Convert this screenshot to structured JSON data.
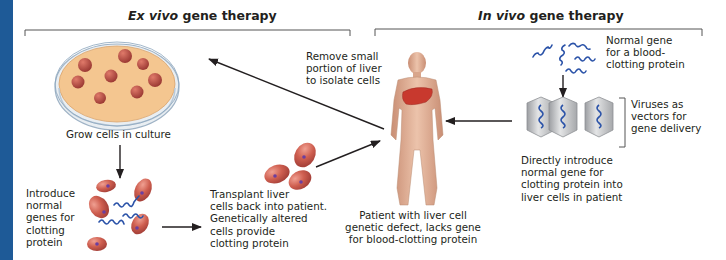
{
  "headings": {
    "ex_vivo": {
      "italic": "Ex vivo",
      "rest": " gene therapy"
    },
    "in_vivo": {
      "italic": "In vivo",
      "rest": " gene therapy"
    }
  },
  "labels": {
    "remove_liver": "Remove small\nportion of liver\nto isolate cells",
    "grow_cells": "Grow cells in culture",
    "introduce_genes": "Introduce\nnormal\ngenes for\nclotting\nprotein",
    "transplant": "Transplant liver\ncells back into patient.\nGenetically altered\ncells provide\nclotting protein",
    "patient": "Patient with liver cell\ngenetic defect, lacks gene\nfor blood-clotting protein",
    "normal_gene": "Normal gene\nfor a blood-\nclotting protein",
    "viruses": "Viruses as\nvectors for\ngene delivery",
    "directly_introduce": "Directly introduce\nnormal gene for\nclotting protein into\nliver cells in patient"
  },
  "icons": {
    "petri_dish": "petri-dish-icon",
    "liver_cell": "liver-cell-icon",
    "gene_strand": "dna-strand-icon",
    "virus_capsid": "virus-capsid-icon",
    "human_figure": "human-body-icon",
    "liver_organ": "liver-icon"
  },
  "colors": {
    "accent_bar": "#1e5a97",
    "cell": "#c8564a",
    "nucleus": "#6b3fa0",
    "gene": "#2a52a8",
    "dish_medium": "#f2c48a",
    "skin": "#e0b49a",
    "liver": "#c8392e",
    "virus": "#b8b9bb"
  }
}
